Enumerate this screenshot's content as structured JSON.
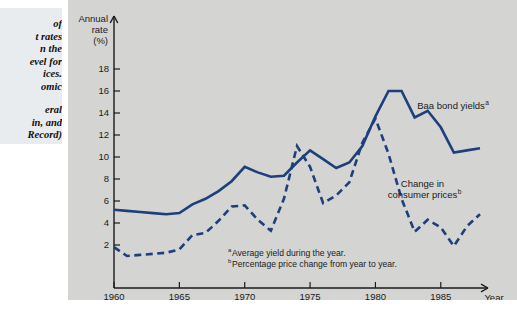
{
  "caption": {
    "body": "of\nt rates\nn the\nevel for\nices.\nomic",
    "source": "eral\nin, and\nRecord)"
  },
  "chart_data": {
    "type": "line",
    "title": "",
    "xlabel": "Year",
    "ylabel": "Annual rate (%)",
    "ylabel_lines": [
      "Annual",
      "rate",
      "(%)"
    ],
    "xlim": [
      1960,
      1988
    ],
    "ylim": [
      0,
      19
    ],
    "grid": false,
    "legend_position": "inline-annotation",
    "y_ticks": [
      2,
      4,
      6,
      8,
      10,
      12,
      14,
      16,
      18
    ],
    "x_ticks": [
      1960,
      1965,
      1970,
      1975,
      1980,
      1985
    ],
    "x": [
      1960,
      1961,
      1962,
      1963,
      1964,
      1965,
      1966,
      1967,
      1968,
      1969,
      1970,
      1971,
      1972,
      1973,
      1974,
      1975,
      1976,
      1977,
      1978,
      1979,
      1980,
      1981,
      1982,
      1983,
      1984,
      1985,
      1986,
      1987,
      1988
    ],
    "series": [
      {
        "name": "Baa bond yields",
        "superscript": "a",
        "style": "solid",
        "color": "#1d3f7a",
        "label_x": 1983.2,
        "label_y": 14.4,
        "values": [
          5.2,
          5.1,
          5.0,
          4.9,
          4.8,
          4.9,
          5.7,
          6.2,
          6.9,
          7.8,
          9.1,
          8.6,
          8.2,
          8.3,
          9.5,
          10.6,
          9.8,
          9.0,
          9.5,
          11.0,
          13.7,
          16.0,
          16.0,
          13.6,
          14.2,
          12.7,
          10.4,
          10.6,
          10.8
        ]
      },
      {
        "name": "Change in consumer prices",
        "superscript": "b",
        "style": "dashed",
        "color": "#1d3f7a",
        "label_x": 1983.6,
        "label_y": 7.3,
        "label_lines": [
          "Change in",
          "consumer prices"
        ],
        "values": [
          1.8,
          1.0,
          1.1,
          1.2,
          1.3,
          1.6,
          2.9,
          3.1,
          4.2,
          5.5,
          5.6,
          4.3,
          3.3,
          6.2,
          11.0,
          9.1,
          5.8,
          6.5,
          7.7,
          11.3,
          13.5,
          10.3,
          6.2,
          3.2,
          4.3,
          3.6,
          1.9,
          3.7,
          4.8
        ]
      }
    ],
    "footnotes": [
      {
        "marker": "a",
        "text": "Average yield during the year."
      },
      {
        "marker": "b",
        "text": "Percentage price change from  year to year."
      }
    ]
  },
  "colors": {
    "series": "#1d3f7a",
    "panel_background": "#d4d5d3",
    "caption_background": "#e9ecef",
    "axis": "#1a1a1a"
  }
}
